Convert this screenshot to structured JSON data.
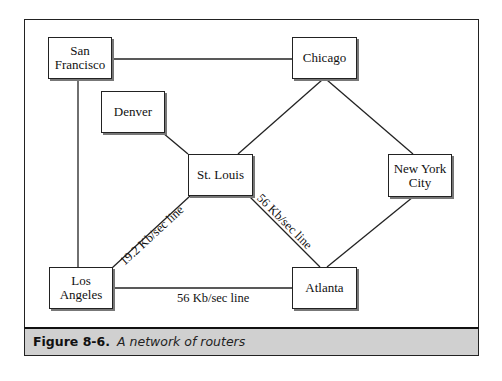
{
  "diagram": {
    "nodes": [
      {
        "id": "sf",
        "label": "San\nFrancisco",
        "x": 48,
        "y": 37,
        "w": 64,
        "h": 42
      },
      {
        "id": "chicago",
        "label": "Chicago",
        "x": 292,
        "y": 37,
        "w": 65,
        "h": 42
      },
      {
        "id": "denver",
        "label": "Denver",
        "x": 101,
        "y": 91,
        "w": 64,
        "h": 42
      },
      {
        "id": "stlouis",
        "label": "St. Louis",
        "x": 188,
        "y": 154,
        "w": 65,
        "h": 42
      },
      {
        "id": "nyc",
        "label": "New York\nCity",
        "x": 388,
        "y": 154,
        "w": 64,
        "h": 43
      },
      {
        "id": "la",
        "label": "Los\nAngeles",
        "x": 49,
        "y": 267,
        "w": 64,
        "h": 42
      },
      {
        "id": "atlanta",
        "label": "Atlanta",
        "x": 292,
        "y": 267,
        "w": 65,
        "h": 42
      }
    ],
    "edges": [
      {
        "from": "sf",
        "to": "chicago",
        "label": ""
      },
      {
        "from": "sf",
        "to": "la",
        "label": ""
      },
      {
        "from": "denver",
        "to": "stlouis",
        "label": ""
      },
      {
        "from": "chicago",
        "to": "stlouis",
        "label": ""
      },
      {
        "from": "chicago",
        "to": "nyc",
        "label": ""
      },
      {
        "from": "stlouis",
        "to": "la",
        "label": "19.2 Kb/sec line"
      },
      {
        "from": "stlouis",
        "to": "atlanta",
        "label": "56 Kb/sec line"
      },
      {
        "from": "nyc",
        "to": "atlanta",
        "label": ""
      },
      {
        "from": "la",
        "to": "atlanta",
        "label": "56 Kb/sec line"
      }
    ],
    "edge_labels": {
      "stlouis_la": "19.2 Kb/sec line",
      "stlouis_atlanta": "56 Kb/sec line",
      "la_atlanta": "56 Kb/sec line"
    }
  },
  "caption": {
    "label": "Figure 8-6.",
    "text": "A network of routers"
  },
  "colors": {
    "line": "#222222",
    "caption_band": "#d0d0d0",
    "shadow": "#777777"
  }
}
